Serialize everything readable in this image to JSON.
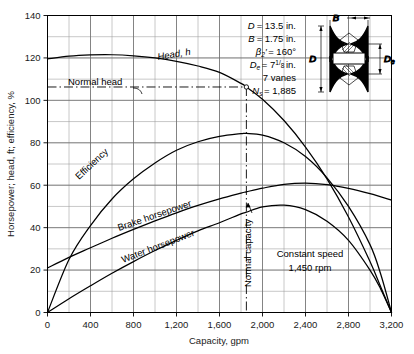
{
  "chart_data": {
    "type": "line",
    "title": "",
    "xlabel": "Capacity, gpm",
    "ylabel": "Horsepower; head, ft; efficiency, %",
    "xlim": [
      0,
      3200
    ],
    "ylim": [
      0,
      140
    ],
    "xticks": [
      0,
      400,
      800,
      1200,
      1600,
      2000,
      2400,
      2800,
      3200
    ],
    "xticklabels": [
      "0",
      "400",
      "800",
      "1,200",
      "1,600",
      "2,000",
      "2,400",
      "2,800",
      "3,200"
    ],
    "yticks": [
      0,
      20,
      40,
      60,
      80,
      100,
      120,
      140
    ],
    "yticklabels": [
      "0",
      "20",
      "40",
      "60",
      "80",
      "100",
      "120",
      "140"
    ],
    "grid": true,
    "grid_x_step": 200,
    "grid_y_step": 10,
    "legend": "none",
    "series": [
      {
        "name": "Head, h",
        "label": "Head, h",
        "x": [
          0,
          200,
          400,
          600,
          800,
          1000,
          1200,
          1400,
          1600,
          1800,
          1850,
          2000,
          2200,
          2400,
          2600,
          2800,
          3000,
          3100,
          3200
        ],
        "values": [
          119.5,
          120.8,
          121.4,
          121.5,
          121.0,
          120.0,
          118.4,
          116.2,
          113.2,
          108.0,
          106.3,
          100.5,
          90.5,
          78.0,
          63.0,
          45.0,
          24.0,
          12.0,
          0.0
        ]
      },
      {
        "name": "Efficiency",
        "label": "Efficiency",
        "x": [
          0,
          200,
          400,
          600,
          800,
          1000,
          1200,
          1400,
          1600,
          1800,
          1850,
          2000,
          2200,
          2400,
          2600,
          2800,
          3000,
          3100,
          3200
        ],
        "values": [
          0.0,
          25.0,
          41.0,
          53.5,
          63.0,
          70.5,
          76.5,
          80.5,
          83.0,
          84.3,
          84.4,
          83.6,
          80.0,
          73.5,
          63.5,
          50.0,
          32.0,
          18.0,
          0.0
        ]
      },
      {
        "name": "Brake horsepower",
        "label": "Brake horsepower",
        "x": [
          0,
          200,
          400,
          600,
          800,
          1000,
          1200,
          1400,
          1600,
          1800,
          1850,
          2000,
          2200,
          2400,
          2600,
          2800,
          3000,
          3200
        ],
        "values": [
          21.0,
          26.0,
          30.5,
          35.0,
          39.2,
          43.2,
          47.0,
          50.5,
          53.6,
          56.3,
          56.9,
          58.6,
          60.4,
          61.0,
          60.3,
          58.5,
          56.0,
          53.0
        ]
      },
      {
        "name": "Water horsepower",
        "label": "Water horsepower",
        "x": [
          0,
          200,
          400,
          600,
          800,
          1000,
          1200,
          1400,
          1600,
          1800,
          1850,
          2000,
          2200,
          2400,
          2600,
          2800,
          3000,
          3100,
          3200
        ],
        "values": [
          0.0,
          6.5,
          12.6,
          18.5,
          24.0,
          29.2,
          34.0,
          38.5,
          42.3,
          46.5,
          47.3,
          49.8,
          50.6,
          48.5,
          43.0,
          34.0,
          20.0,
          11.0,
          0.0
        ]
      }
    ],
    "annotations": {
      "normal_head_value": 106.3,
      "normal_head_label": "Normal head",
      "normal_capacity_value": 1850,
      "normal_capacity_label": "Normal capacity",
      "operating_point": [
        1850,
        106.3
      ]
    }
  },
  "specs": {
    "diameter_symbol": "D",
    "diameter_value": "= 13.5 in.",
    "width_symbol": "B",
    "width_value": "= 1.75 in.",
    "beta_symbol": "β",
    "beta_sub": "2",
    "beta_prime": "′",
    "beta_value": "= 160°",
    "eye_symbol": "D",
    "eye_sub": "e",
    "eye_value": "= 7",
    "eye_frac_num": "1",
    "eye_frac_den": "8",
    "eye_unit": "in.",
    "vanes": "7 vanes",
    "ns_symbol": "N",
    "ns_sub": "s",
    "ns_value": "= 1,885"
  },
  "impeller": {
    "label_B": "B",
    "label_D": "D",
    "label_De": "D",
    "label_De_sub": "e"
  },
  "speed_note": {
    "line1": "Constant speed",
    "line2": "1,450 rpm"
  }
}
